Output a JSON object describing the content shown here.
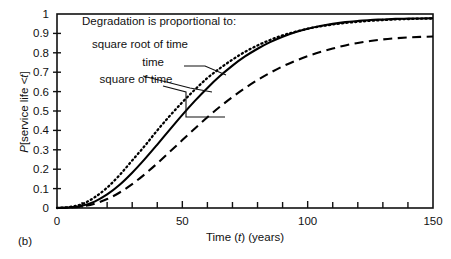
{
  "figure": {
    "caption": "(b)"
  },
  "chart_data": {
    "type": "line",
    "title": "",
    "xlabel_parts": {
      "pre": "Time (",
      "var": "t",
      "post": ") (years)"
    },
    "xlabel": "Time (t) (years)",
    "ylabel_parts": {
      "pre": "P",
      "mid": "[service life <",
      "var": "t",
      "post": "]"
    },
    "ylabel": "P[service life <t]",
    "xlim": [
      0,
      150
    ],
    "ylim": [
      0,
      1
    ],
    "x_major_ticks": [
      0,
      50,
      100,
      150
    ],
    "x_major_tick_labels": [
      "0",
      "50",
      "100",
      "150"
    ],
    "x_minor_tick_step": 10,
    "y_ticks": [
      0,
      0.1,
      0.2,
      0.3,
      0.4,
      0.5,
      0.6,
      0.7,
      0.8,
      0.9,
      1
    ],
    "y_tick_labels": [
      "0",
      "0.1",
      "0.2",
      "0.3",
      "0.4",
      "0.5",
      "0.6",
      "0.7",
      "0.8",
      "0.9",
      "1"
    ],
    "grid": false,
    "legend_position": "inside-upper-left",
    "legend_title": "Degradation is proportional to:",
    "annotations": [
      {
        "text": "Degradation is proportional to:",
        "x": 10,
        "y": 0.965
      },
      {
        "text": "square root of time",
        "x": 14,
        "y": 0.845
      },
      {
        "text": "time",
        "x": 34,
        "y": 0.755
      },
      {
        "text": "square of time",
        "x": 17,
        "y": 0.665
      }
    ],
    "x": [
      0,
      5,
      10,
      15,
      20,
      25,
      30,
      35,
      40,
      45,
      50,
      55,
      60,
      65,
      70,
      75,
      80,
      85,
      90,
      95,
      100,
      105,
      110,
      115,
      120,
      125,
      130,
      135,
      140,
      145,
      150
    ],
    "series": [
      {
        "name": "square root of time",
        "style": "dotted",
        "color": "#000000",
        "values": [
          0.0,
          0.005,
          0.02,
          0.055,
          0.105,
          0.17,
          0.245,
          0.32,
          0.4,
          0.475,
          0.545,
          0.61,
          0.67,
          0.72,
          0.765,
          0.805,
          0.838,
          0.866,
          0.89,
          0.908,
          0.924,
          0.936,
          0.946,
          0.954,
          0.96,
          0.965,
          0.969,
          0.972,
          0.974,
          0.976,
          0.977
        ]
      },
      {
        "name": "time",
        "style": "solid",
        "color": "#000000",
        "values": [
          0.0,
          0.003,
          0.012,
          0.033,
          0.07,
          0.12,
          0.182,
          0.252,
          0.327,
          0.404,
          0.48,
          0.552,
          0.619,
          0.68,
          0.734,
          0.781,
          0.821,
          0.855,
          0.883,
          0.906,
          0.924,
          0.938,
          0.949,
          0.958,
          0.964,
          0.969,
          0.972,
          0.975,
          0.976,
          0.977,
          0.978
        ]
      },
      {
        "name": "square of time",
        "style": "dashed",
        "color": "#000000",
        "values": [
          0.0,
          0.002,
          0.008,
          0.022,
          0.046,
          0.08,
          0.123,
          0.174,
          0.23,
          0.29,
          0.35,
          0.41,
          0.468,
          0.522,
          0.572,
          0.618,
          0.66,
          0.697,
          0.73,
          0.758,
          0.783,
          0.804,
          0.822,
          0.838,
          0.851,
          0.861,
          0.869,
          0.875,
          0.879,
          0.882,
          0.884
        ]
      }
    ]
  }
}
